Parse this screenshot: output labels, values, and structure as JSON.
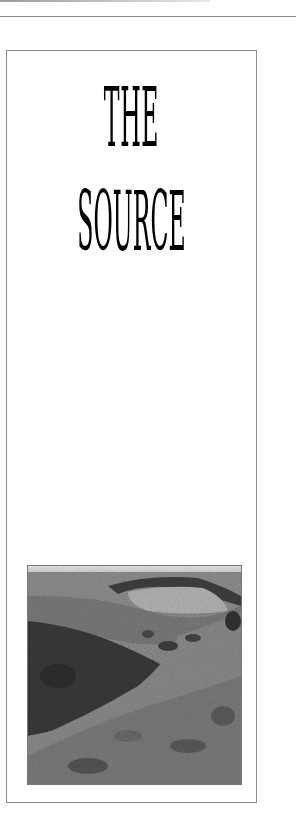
{
  "page": {
    "title_line_1": "THE",
    "title_line_2": "SOURCE"
  },
  "photo": {
    "subject": "moorland-valley-landscape",
    "tone": "black-and-white"
  },
  "colors": {
    "background": "#ffffff",
    "frame_border": "#8c8c8c",
    "title_text": "#000000"
  }
}
